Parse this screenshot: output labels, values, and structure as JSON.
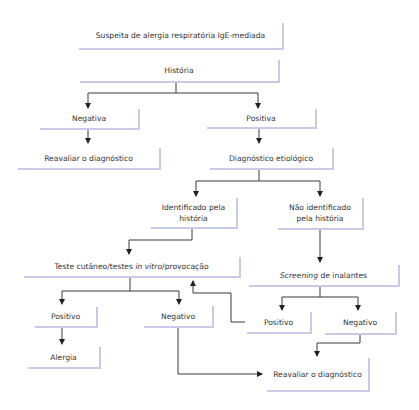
{
  "colors": {
    "box_border": "#c9c9e8",
    "text": "#333333",
    "connector": "#3a3a3a",
    "background": "#ffffff"
  },
  "nodes": {
    "start": {
      "label": "Suspeita de alergia respiratória IgE-mediada"
    },
    "historia": {
      "label": "História"
    },
    "negativa": {
      "label": "Negativa"
    },
    "positiva": {
      "label": "Positiva"
    },
    "reavaliar_1": {
      "label": "Reavaliar o diagnóstico"
    },
    "diagnostico_etiologico": {
      "label": "Diagnóstico etiológico"
    },
    "identificado": {
      "line1": "Identificado pela",
      "line2": "história"
    },
    "nao_identificado": {
      "line1": "Não identificado",
      "line2": "pela história"
    },
    "teste": {
      "part1": "Teste cutâneo/testes ",
      "italic": "in vitro",
      "part2": "/provocação"
    },
    "screening": {
      "italic": "Screening",
      "rest": " de inalantes"
    },
    "positivo_left": {
      "label": "Positivo"
    },
    "negativo_left": {
      "label": "Negativo"
    },
    "positivo_right": {
      "label": "Positivo"
    },
    "negativo_right": {
      "label": "Negativo"
    },
    "alergia": {
      "label": "Alergia"
    },
    "reavaliar_2": {
      "label": "Reavaliar o diagnóstico"
    }
  },
  "edges": [
    [
      "start",
      "historia"
    ],
    [
      "historia",
      "negativa"
    ],
    [
      "historia",
      "positiva"
    ],
    [
      "negativa",
      "reavaliar_1"
    ],
    [
      "positiva",
      "diagnostico_etiologico"
    ],
    [
      "diagnostico_etiologico",
      "identificado"
    ],
    [
      "diagnostico_etiologico",
      "nao_identificado"
    ],
    [
      "identificado",
      "teste"
    ],
    [
      "nao_identificado",
      "screening"
    ],
    [
      "teste",
      "positivo_left"
    ],
    [
      "teste",
      "negativo_left"
    ],
    [
      "positivo_left",
      "alergia"
    ],
    [
      "negativo_left",
      "reavaliar_2"
    ],
    [
      "screening",
      "positivo_right"
    ],
    [
      "screening",
      "negativo_right"
    ],
    [
      "positivo_right",
      "teste"
    ],
    [
      "negativo_right",
      "reavaliar_2"
    ]
  ]
}
